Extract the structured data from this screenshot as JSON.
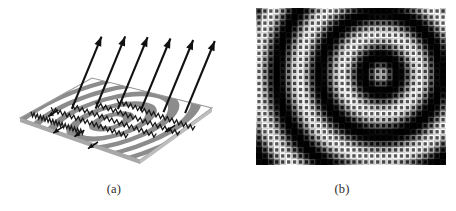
{
  "figure": {
    "background_color": "#ffffff",
    "panels": [
      {
        "id": "a",
        "caption": "(a)",
        "kind": "3d-wave-surface-with-vectors",
        "description": "Perspective view of a planar surface carrying concentric circular ripples radiating from a point source, with large arrows rising off the surface and small in-plane arrows.",
        "surface": {
          "shape": "parallelogram",
          "ring_count": 11,
          "ring_center_u": 0.5,
          "ring_center_v": 0.44,
          "ring_fill_color": "#8c8c8c",
          "ring_gap_color": "#ffffff",
          "edge_color": "#9a9a9a"
        },
        "large_arrows": {
          "count": 6,
          "color": "#111111",
          "direction_label": "up-right",
          "length_px": 78
        },
        "small_arrows": {
          "count": 5,
          "color": "#111111",
          "direction_label": "down-left-in-plane"
        },
        "zigzag_wavefronts": {
          "count": 5,
          "color": "#1a1a1a"
        }
      },
      {
        "id": "b",
        "caption": "(b)",
        "kind": "sampled-grayscale-lattice",
        "description": "Grayscale intensity map of the same concentric interference pattern sampled on a square lattice of square apertures.",
        "grid": {
          "columns": 32,
          "rows": 26,
          "cell_px": 5.95,
          "background_color": "#000000",
          "bright_color": "#ffffff",
          "left_px": 256,
          "top_px": 8,
          "width_px": 190,
          "height_px": 157
        },
        "pattern": {
          "type": "concentric-rings",
          "center_col": 20.5,
          "center_row": 10.5,
          "wavelength_cells": 7.2,
          "phase": 0.55,
          "falloff": 0.0
        }
      }
    ]
  },
  "chart_data": {
    "type": "heatmap",
    "title": "",
    "xlabel": "",
    "ylabel": "",
    "legend": "none",
    "grid": true,
    "columns": 32,
    "rows": 26,
    "value_range": [
      0,
      1
    ],
    "center_col": 20.5,
    "center_row": 10.5,
    "wavelength_cells": 7.2,
    "phase": 0.55
  }
}
